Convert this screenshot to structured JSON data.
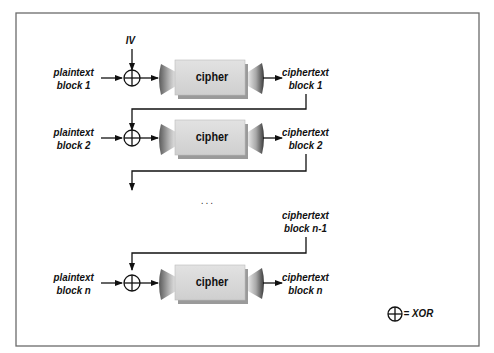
{
  "diagram": {
    "iv_label": "IV",
    "ellipsis": ". . .",
    "legend": {
      "symbol": "⊕",
      "text": "= XOR"
    },
    "rows": [
      {
        "plaintext_line1": "plaintext",
        "plaintext_line2": "block 1",
        "cipher": "cipher",
        "ciphertext_line1": "ciphertext",
        "ciphertext_line2": "block 1"
      },
      {
        "plaintext_line1": "plaintext",
        "plaintext_line2": "block 2",
        "cipher": "cipher",
        "ciphertext_line1": "ciphertext",
        "ciphertext_line2": "block 2"
      },
      {
        "plaintext_line1": "plaintext",
        "plaintext_line2": "block n",
        "cipher": "cipher",
        "ciphertext_line1": "ciphertext",
        "ciphertext_line2": "block n"
      }
    ],
    "prev_ciphertext": {
      "line1": "ciphertext",
      "line2": "block n-1"
    },
    "colors": {
      "border": "#6b6b6b",
      "line": "#111111",
      "block_face": "#d4d4d4",
      "block_shadow": "#9a9a9a",
      "cone_dark": "#555555",
      "cone_light": "#e0e0e0"
    }
  }
}
